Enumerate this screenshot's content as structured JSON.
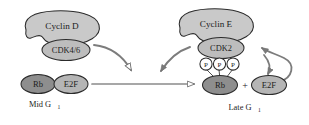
{
  "diagram": {
    "colors": {
      "cyclin_fill": "#c9c9c9",
      "cdk_fill": "#bdbdbd",
      "rb_fill": "#8e8e8e",
      "e2f_fill": "#b5b5b5",
      "phosphate_fill": "#ffffff",
      "outline": "#2b2b2b",
      "arrow": "#6f6f6f",
      "text": "#1d1d1d"
    },
    "left_panel": {
      "stage_label": "Mid G",
      "stage_subscript": "1",
      "cyclin": {
        "label": "Cyclin D",
        "shape": "crescent-blob"
      },
      "cdk": {
        "label": "CDK4/6",
        "shape": "ellipse"
      },
      "complex": [
        {
          "label": "Rb",
          "shape": "ellipse",
          "shade": "dark"
        },
        {
          "label": "E2F",
          "shape": "ellipse",
          "shade": "medium"
        }
      ]
    },
    "right_panel": {
      "stage_label": "Late G",
      "stage_subscript": "1",
      "cyclin": {
        "label": "Cyclin E",
        "shape": "crescent-blob"
      },
      "cdk": {
        "label": "CDK2",
        "shape": "ellipse"
      },
      "phosphates": [
        {
          "label": "P"
        },
        {
          "label": "P"
        },
        {
          "label": "P"
        }
      ],
      "rb": {
        "label": "Rb",
        "shape": "ellipse",
        "shade": "dark"
      },
      "separator": "+",
      "e2f": {
        "label": "E2F",
        "shape": "ellipse",
        "shade": "medium"
      }
    },
    "arrows": [
      {
        "name": "cdk46-to-rb-complex",
        "head": "open",
        "style": "curved"
      },
      {
        "name": "mid-g1-to-late-g1",
        "head": "open",
        "style": "straight-horizontal"
      },
      {
        "name": "cyclin-e-cdk2-phosphorylates",
        "head": "solid",
        "style": "curved"
      },
      {
        "name": "e2f-feedback-to-cdk2",
        "head": "solid",
        "style": "curved-loop"
      },
      {
        "name": "e2f-release",
        "head": "solid",
        "style": "curved-down"
      }
    ]
  }
}
